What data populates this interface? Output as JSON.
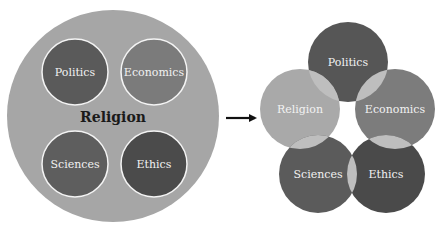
{
  "left_diagram": {
    "container": {
      "label": "Religion",
      "color": "#a6a6a6",
      "cx": 113,
      "cy": 116,
      "r": 106
    },
    "circles": [
      {
        "label": "Politics",
        "color": "#5a5a5a",
        "cx": 75,
        "cy": 72,
        "r": 33
      },
      {
        "label": "Economics",
        "color": "#7b7b7b",
        "cx": 154,
        "cy": 72,
        "r": 33
      },
      {
        "label": "Sciences",
        "color": "#5e5e5e",
        "cx": 75,
        "cy": 164,
        "r": 33
      },
      {
        "label": "Ethics",
        "color": "#4b4b4b",
        "cx": 154,
        "cy": 164,
        "r": 33
      }
    ]
  },
  "arrow": {
    "x1": 226,
    "x2": 261,
    "y": 118,
    "color": "#111111"
  },
  "right_diagram": {
    "circles": [
      {
        "label": "Politics",
        "color": "#565656",
        "cx": 348,
        "cy": 62,
        "r": 40
      },
      {
        "label": "Religion",
        "color": "#a9a9a9",
        "cx": 300,
        "cy": 109,
        "r": 40
      },
      {
        "label": "Economics",
        "color": "#7c7c7c",
        "cx": 395,
        "cy": 109,
        "r": 40
      },
      {
        "label": "Sciences",
        "color": "#5b5b5b",
        "cx": 318,
        "cy": 174,
        "r": 39
      },
      {
        "label": "Ethics",
        "color": "#4a4a4a",
        "cx": 386,
        "cy": 174,
        "r": 39
      }
    ],
    "overlap_color": "#bebebe"
  }
}
